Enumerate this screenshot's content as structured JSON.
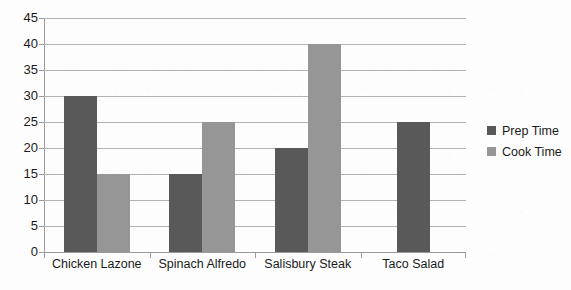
{
  "chart_data": {
    "type": "bar",
    "title": "",
    "subtitle": "",
    "xlabel": "",
    "ylabel": "",
    "categories": [
      "Chicken Lazone",
      "Spinach Alfredo",
      "Salisbury Steak",
      "Taco Salad"
    ],
    "series": [
      {
        "name": "Prep Time",
        "color": "#595959",
        "values": [
          30,
          15,
          20,
          25
        ]
      },
      {
        "name": "Cook Time",
        "color": "#969696",
        "values": [
          15,
          25,
          40,
          null
        ]
      }
    ],
    "ylim": [
      0,
      45
    ],
    "ytick_step": 5,
    "yticks": [
      45,
      40,
      35,
      30,
      25,
      20,
      15,
      10,
      5,
      0
    ],
    "ytick_labels": [
      "45",
      "40",
      "35",
      "30",
      "25",
      "20",
      "15",
      "10",
      "5",
      "0"
    ],
    "grid": true,
    "grid_axis": "y",
    "legend_position": "right",
    "annotations": []
  },
  "legend": {
    "items": [
      {
        "label": "Prep Time",
        "color": "#595959"
      },
      {
        "label": "Cook Time",
        "color": "#969696"
      }
    ]
  },
  "colors": {
    "prep_time": "#595959",
    "cook_time": "#969696",
    "gridline": "#b2b2b2",
    "axis": "#9a9a9a",
    "text": "#1a1a1a",
    "background": "#fdfdfd"
  }
}
